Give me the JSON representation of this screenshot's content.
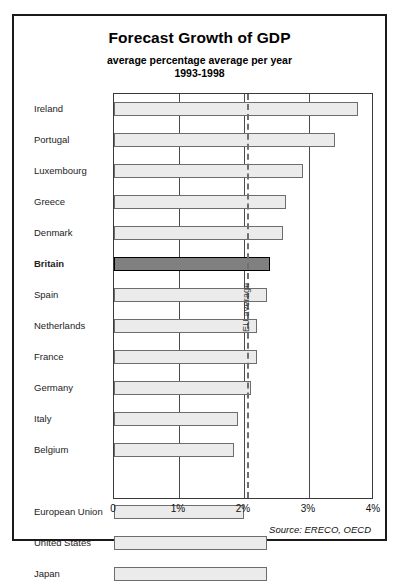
{
  "chart_data": {
    "type": "bar",
    "orientation": "horizontal",
    "title": "Forecast Growth of GDP",
    "subtitle": "average percentage average per year",
    "subtitle2": "1993-1998",
    "xlabel": "",
    "ylabel": "",
    "xlim": [
      0,
      4
    ],
    "grid": true,
    "grid_axis": "x",
    "legend": false,
    "source": "Source: ERECO, OECD",
    "xtick_labels": [
      "0",
      "1%",
      "2%",
      "3%",
      "4%"
    ],
    "xtick_values": [
      0,
      1,
      2,
      3,
      4
    ],
    "categories": [
      "Ireland",
      "Portugal",
      "Luxembourg",
      "Greece",
      "Denmark",
      "Britain",
      "Spain",
      "Netherlands",
      "France",
      "Germany",
      "Italy",
      "Belgium",
      "",
      "European Union",
      "United States",
      "Japan"
    ],
    "values": [
      3.75,
      3.4,
      2.9,
      2.65,
      2.6,
      2.4,
      2.35,
      2.2,
      2.2,
      2.1,
      1.9,
      1.85,
      null,
      2.0,
      2.35,
      2.35
    ],
    "highlight_category": "Britain",
    "highlight_index": 5,
    "annotations": [
      {
        "name": "eu-average",
        "label": "EU average",
        "value": 2.05,
        "style": "dashed-vertical"
      }
    ],
    "colors": {
      "bar_fill": "#ebebeb",
      "bar_edge": "#6d6d6d",
      "highlight_fill": "#808080",
      "highlight_edge": "#000000",
      "grid": "#4a4a4a",
      "frame": "#1a1a1a",
      "annotation_line": "#6f6f6f",
      "text": "#111111"
    }
  }
}
